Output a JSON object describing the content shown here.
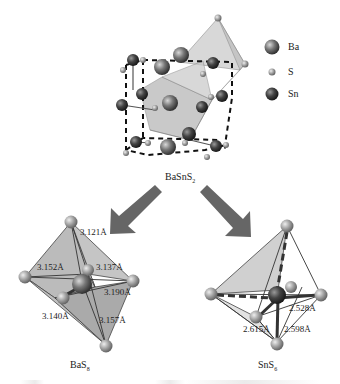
{
  "figure": {
    "crystal": {
      "formula_main": "BaSnS",
      "formula_sub": "2",
      "legend": [
        {
          "label": "Ba",
          "icon": "ba-atom-icon",
          "color": "#555555"
        },
        {
          "label": "S",
          "icon": "s-atom-icon",
          "color": "#999999"
        },
        {
          "label": "Sn",
          "icon": "sn-atom-icon",
          "color": "#333333"
        }
      ]
    },
    "ba_polyhedron": {
      "formula_main": "BaS",
      "formula_sub": "8",
      "distances": [
        "3.121Å",
        "3.152Å",
        "3.137Å",
        "3.190Å",
        "3.140Å",
        "3.157Å"
      ]
    },
    "sn_polyhedron": {
      "formula_main": "SnS",
      "formula_sub": "6",
      "distances": [
        "2.528Å",
        "2.615Å",
        "2.598Å"
      ]
    },
    "arrows": [
      "arrow-to-BaS8",
      "arrow-to-SnS6"
    ]
  }
}
